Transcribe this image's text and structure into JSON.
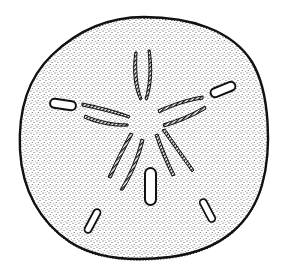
{
  "image": {
    "subject": "sand dollar",
    "style": "black stipple ink illustration",
    "colors": {
      "background": "#ffffff",
      "ink": "#111111",
      "stipple": "#3a3a3a"
    }
  },
  "illustration": {
    "features": [
      {
        "name": "test-outline",
        "description": "rounded pentagonal shell with fringed edge"
      },
      {
        "name": "petal-top",
        "description": "hatched petaloid ambulacrum"
      },
      {
        "name": "petal-upper-left",
        "description": "hatched petaloid ambulacrum"
      },
      {
        "name": "petal-upper-right",
        "description": "hatched petaloid ambulacrum"
      },
      {
        "name": "petal-lower-left",
        "description": "hatched petaloid ambulacrum"
      },
      {
        "name": "petal-lower-right",
        "description": "hatched petaloid ambulacrum"
      },
      {
        "name": "lunule-left",
        "description": "elongated slot"
      },
      {
        "name": "lunule-right",
        "description": "elongated slot"
      },
      {
        "name": "lunule-bottom-center",
        "description": "elongated slot"
      },
      {
        "name": "lunule-lower-left",
        "description": "elongated slot"
      },
      {
        "name": "lunule-lower-right",
        "description": "elongated slot"
      }
    ]
  }
}
